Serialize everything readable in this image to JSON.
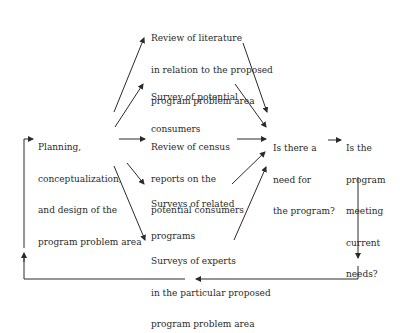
{
  "diagram": {
    "nodes": {
      "planning": {
        "lines": [
          "Planning,",
          "conceptualization,",
          "and design of the",
          "program problem area"
        ]
      },
      "literature": {
        "lines": [
          "Review of literature",
          "in relation to the proposed",
          "program problem area"
        ]
      },
      "consumers": {
        "lines": [
          "Survey of potential",
          "consumers"
        ]
      },
      "census": {
        "lines": [
          "Review of census",
          "reports on the",
          "potential consumers"
        ]
      },
      "related": {
        "lines": [
          "Surveys of related",
          "programs"
        ]
      },
      "experts": {
        "lines": [
          "Surveys of experts",
          "in the particular proposed",
          "program problem area"
        ]
      },
      "need": {
        "lines": [
          "Is there a",
          "need for",
          "the program?"
        ]
      },
      "meeting": {
        "lines": [
          "Is the",
          "program",
          "meeting",
          "current",
          "needs?"
        ]
      }
    },
    "edges": [
      {
        "from": "planning",
        "to": "literature"
      },
      {
        "from": "planning",
        "to": "consumers"
      },
      {
        "from": "planning",
        "to": "census"
      },
      {
        "from": "planning",
        "to": "related"
      },
      {
        "from": "planning",
        "to": "experts"
      },
      {
        "from": "literature",
        "to": "need"
      },
      {
        "from": "consumers",
        "to": "need"
      },
      {
        "from": "census",
        "to": "need"
      },
      {
        "from": "related",
        "to": "need"
      },
      {
        "from": "experts",
        "to": "need"
      },
      {
        "from": "need",
        "to": "meeting"
      },
      {
        "from": "meeting",
        "to": "planning",
        "type": "feedback-loop"
      }
    ],
    "colors": {
      "line": "#2a2a2a",
      "text": "#2a2a2a",
      "background": "#ffffff"
    }
  }
}
